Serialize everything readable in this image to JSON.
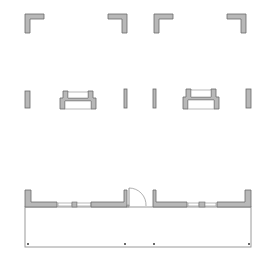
{
  "colors": {
    "background": "#ffffff",
    "wall_fill": "#b8b8b8",
    "wall_stroke": "#6a6a6a",
    "window_fill": "#ffffff",
    "window_stroke": "#8a8a8a",
    "outline_stroke": "#9a9a9a",
    "door_stroke": "#7a7a7a"
  },
  "corners": [
    {
      "name": "corner-top-left-a",
      "x": 25,
      "y": 14,
      "dir": "tl"
    },
    {
      "name": "corner-top-right-a",
      "x": 127,
      "y": 14,
      "dir": "tr"
    },
    {
      "name": "corner-top-left-b",
      "x": 154,
      "y": 14,
      "dir": "tl"
    },
    {
      "name": "corner-top-right-b",
      "x": 246,
      "y": 14,
      "dir": "tr"
    }
  ],
  "posts": [
    {
      "name": "post-left-a",
      "x": 25,
      "y": 91,
      "w": 5,
      "h": 17
    },
    {
      "name": "post-right-a",
      "x": 124,
      "y": 89,
      "w": 3,
      "h": 19
    },
    {
      "name": "post-left-b",
      "x": 153,
      "y": 89,
      "w": 3,
      "h": 19
    },
    {
      "name": "post-right-b",
      "x": 246,
      "y": 89,
      "w": 5,
      "h": 19
    }
  ],
  "window_units": [
    {
      "name": "window-unit-a",
      "x": 60,
      "y": 91,
      "w": 36,
      "h": 18
    },
    {
      "name": "window-unit-b",
      "x": 183,
      "y": 89,
      "w": 36,
      "h": 20
    }
  ],
  "bottom_plan": {
    "door_center_x": 139,
    "labels": []
  }
}
